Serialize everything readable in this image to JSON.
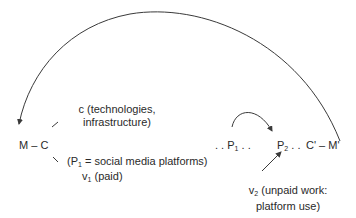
{
  "diagram": {
    "type": "circuit-of-capital",
    "nodes": {
      "m_c": "M – C",
      "c_label_line1": "c (technologies,",
      "c_label_line2": "infrastructure)",
      "p1_label_prefix": "(P",
      "p1_label_sub": "1",
      "p1_label_suffix": " = social media platforms)",
      "v1_prefix": "v",
      "v1_sub": "1",
      "v1_suffix": " (paid)",
      "p1_prefix": ". . P",
      "p1_sub": "1",
      "p1_suffix": " . .",
      "p2_prefix": "P",
      "p2_sub": "2",
      "p2_suffix": " . .",
      "c_prime_m_prime": "C' – M'",
      "v2_prefix": "v",
      "v2_sub": "2",
      "v2_suffix": " (unpaid work:",
      "v2_line2": "platform use)"
    },
    "edges": [
      {
        "from": "C'–M'",
        "to": "M–C",
        "style": "large-arc-arrow"
      },
      {
        "from": "P1",
        "to": "P2",
        "style": "small-arc-arrow"
      },
      {
        "from": "v2",
        "to": "P2",
        "style": "straight-arrow"
      },
      {
        "from": "C",
        "to": "c",
        "style": "line"
      },
      {
        "from": "C",
        "to": "v1",
        "style": "line"
      }
    ],
    "colors": {
      "line": "#3a3a3a",
      "text": "#2a2a2a",
      "background": "#ffffff"
    }
  }
}
